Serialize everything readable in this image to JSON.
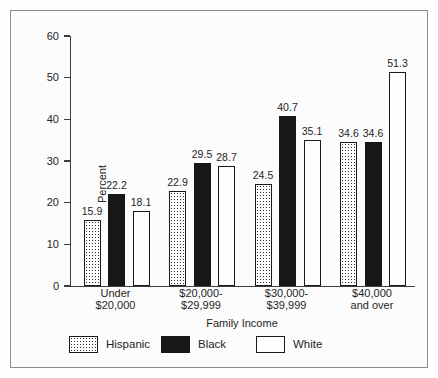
{
  "chart_data": {
    "type": "bar",
    "title": "",
    "ylabel": "Percent",
    "xlabel": "Family Income",
    "ylim": [
      0,
      60
    ],
    "yticks": [
      0,
      10,
      20,
      30,
      40,
      50,
      60
    ],
    "grid": false,
    "legend_position": "bottom",
    "bar_value_labels": true,
    "categories": [
      [
        "Under",
        "$20,000"
      ],
      [
        "$20,000-",
        "$29,999"
      ],
      [
        "$30,000-",
        "$39,999"
      ],
      [
        "$40,000",
        "and over"
      ]
    ],
    "series": [
      {
        "name": "Hispanic",
        "style": "dotted-pattern",
        "values": [
          15.9,
          22.9,
          24.5,
          34.6
        ]
      },
      {
        "name": "Black",
        "style": "solid-black",
        "values": [
          22.2,
          29.5,
          40.7,
          34.6
        ]
      },
      {
        "name": "White",
        "style": "white-outline",
        "values": [
          18.1,
          28.7,
          35.1,
          51.3
        ]
      }
    ]
  },
  "colors": {
    "axis": "#3f3f3f",
    "text": "#252525",
    "figure_border": "#8c8c8c",
    "figure_bg": "#fcfcfc",
    "bar_black": "#171717",
    "bar_white": "#fdfdfd"
  }
}
